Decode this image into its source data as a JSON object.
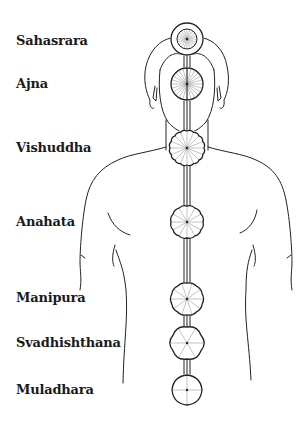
{
  "title": "",
  "colors": {
    "line": "#222222",
    "spoke": "#9a9a9a",
    "background": "#ffffff"
  },
  "chakras": [
    {
      "name": "Sahasrara",
      "petals": 20,
      "cx": 187,
      "cy": 39,
      "r": 16,
      "inner_r": 10,
      "label_y": 33
    },
    {
      "name": "Ajna",
      "petals": 2,
      "cx": 187,
      "cy": 84,
      "r": 16,
      "label_y": 76
    },
    {
      "name": "Vishuddha",
      "petals": 16,
      "cx": 187,
      "cy": 148,
      "r": 17,
      "label_y": 140
    },
    {
      "name": "Anahata",
      "petals": 12,
      "cx": 187,
      "cy": 222,
      "r": 16,
      "label_y": 214
    },
    {
      "name": "Manipura",
      "petals": 10,
      "cx": 187,
      "cy": 299,
      "r": 16,
      "label_y": 290
    },
    {
      "name": "Svadhishthana",
      "petals": 6,
      "cx": 187,
      "cy": 343,
      "r": 16,
      "label_y": 335
    },
    {
      "name": "Muladhara",
      "petals": 4,
      "cx": 187,
      "cy": 390,
      "r": 15,
      "label_y": 382
    }
  ]
}
